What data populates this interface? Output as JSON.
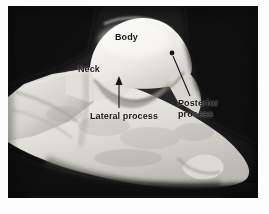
{
  "figure": {
    "background_color": "#ffffff",
    "photo": {
      "frame_color": "#0b0b0b",
      "bone_color": "#e9e7e2",
      "shadow_color": "#141414",
      "left": 8,
      "top": 6,
      "width": 250,
      "height": 192
    }
  },
  "annotations": {
    "body": {
      "label": "Body",
      "x": 115,
      "y": 32,
      "leader": "none"
    },
    "neck": {
      "label": "Neck",
      "x": 78,
      "y": 64,
      "leader": "none"
    },
    "lateral_process": {
      "label": "Lateral process",
      "x": 90,
      "y": 111,
      "leader": "vertical-arrow-up"
    },
    "posterior_process": {
      "label_line1": "Posterior",
      "label_line2": "process",
      "x": 178,
      "y": 98,
      "leader": "diagonal-line-to-upper-left"
    }
  },
  "colors": {
    "text": "#121212",
    "leader_line": "#1b1b1b",
    "photo_dark": "#0b0b0b",
    "bone_light": "#efeeea"
  }
}
